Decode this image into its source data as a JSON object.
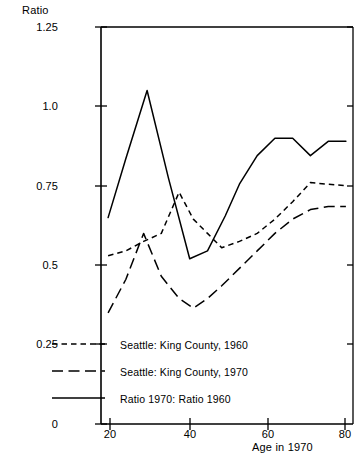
{
  "chart_data": {
    "type": "line",
    "title": "",
    "xlabel": "Age in 1970",
    "ylabel": "Ratio",
    "xlim": [
      11,
      82
    ],
    "ylim": [
      0,
      1.25
    ],
    "grid": false,
    "legend_position": "bottom-left-inside",
    "xticks": [
      20,
      40,
      60,
      80
    ],
    "xtick_labels": [
      "20",
      "40",
      "60",
      "80"
    ],
    "yticks": [
      0,
      0.25,
      0.5,
      0.75,
      1.0,
      1.25
    ],
    "ytick_labels": [
      "0",
      "0.25",
      "0.5",
      "0.75",
      "1.0",
      "1.25"
    ],
    "series": [
      {
        "name": "Seattle: King County, 1960",
        "style": "short-dashed",
        "color": "#000000",
        "x": [
          13,
          18,
          23,
          28,
          33,
          37,
          41,
          45,
          50,
          55,
          60,
          65,
          70,
          75,
          80
        ],
        "values": [
          0.53,
          0.545,
          0.575,
          0.6,
          0.73,
          0.645,
          0.6,
          0.555,
          0.575,
          0.6,
          0.645,
          0.7,
          0.76,
          0.755,
          0.75
        ]
      },
      {
        "name": "Seattle: King County, 1970",
        "style": "long-dashed",
        "color": "#000000",
        "x": [
          13,
          18,
          23,
          28,
          33,
          37,
          41,
          45,
          50,
          55,
          60,
          65,
          70,
          75,
          80
        ],
        "values": [
          0.35,
          0.455,
          0.6,
          0.465,
          0.395,
          0.365,
          0.395,
          0.435,
          0.49,
          0.545,
          0.6,
          0.645,
          0.675,
          0.685,
          0.685
        ]
      },
      {
        "name": "Ratio 1970: Ratio 1960",
        "style": "solid",
        "color": "#000000",
        "x": [
          13,
          18,
          24,
          30,
          36,
          41,
          46,
          50,
          55,
          60,
          65,
          70,
          75,
          80
        ],
        "values": [
          0.65,
          0.835,
          1.05,
          0.775,
          0.52,
          0.545,
          0.655,
          0.755,
          0.845,
          0.9,
          0.9,
          0.845,
          0.89,
          0.89
        ]
      }
    ]
  },
  "axes": {
    "ylabel": "Ratio",
    "xlabel": "Age in 1970"
  },
  "legend": {
    "items": [
      {
        "label": "Seattle: King County, 1960",
        "style": "short-dashed"
      },
      {
        "label": "Seattle: King County, 1970",
        "style": "long-dashed"
      },
      {
        "label": "Ratio 1970: Ratio 1960",
        "style": "solid"
      }
    ]
  },
  "ticks": {
    "y": [
      "1.25",
      "1.0",
      "0.75",
      "0.5",
      "0.25",
      "0"
    ],
    "x": [
      "20",
      "40",
      "60",
      "80"
    ]
  }
}
